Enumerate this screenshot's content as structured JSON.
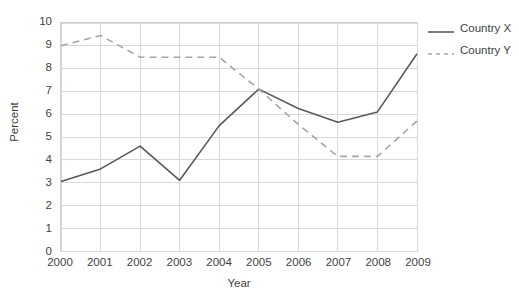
{
  "chart_data": {
    "type": "line",
    "title": "",
    "xlabel": "Year",
    "ylabel": "Percent",
    "categories": [
      "2000",
      "2001",
      "2002",
      "2003",
      "2004",
      "2005",
      "2006",
      "2007",
      "2008",
      "2009"
    ],
    "x": [
      2000,
      2001,
      2002,
      2003,
      2004,
      2005,
      2006,
      2007,
      2008,
      2009
    ],
    "series": [
      {
        "name": "Country X",
        "style": "solid",
        "color": "#595959",
        "values": [
          3.05,
          3.6,
          4.6,
          3.1,
          5.5,
          7.1,
          6.25,
          5.65,
          6.1,
          8.65
        ]
      },
      {
        "name": "Country Y",
        "style": "dashed",
        "color": "#a6a6a6",
        "values": [
          9.0,
          9.45,
          8.5,
          8.5,
          8.5,
          7.1,
          5.55,
          4.15,
          4.15,
          5.7
        ]
      }
    ],
    "ylim": [
      0,
      10
    ],
    "ytick_step": 1,
    "yticks": [
      "10",
      "9",
      "8",
      "7",
      "6",
      "5",
      "4",
      "3",
      "2",
      "1",
      "0"
    ],
    "grid": true,
    "grid_color": "#d9d9d9",
    "legend_position": "top-right",
    "background": "#ffffff"
  }
}
